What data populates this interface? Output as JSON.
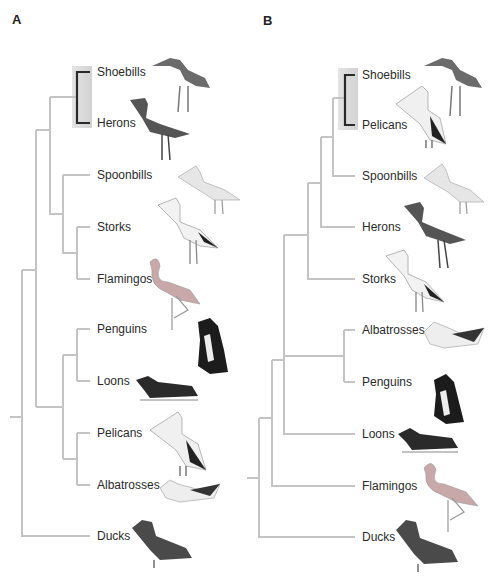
{
  "figure": {
    "panels": [
      {
        "id": "A",
        "letter": "A",
        "leaves": [
          {
            "name": "Shoebills",
            "y": 72
          },
          {
            "name": "Herons",
            "y": 123
          },
          {
            "name": "Spoonbills",
            "y": 175
          },
          {
            "name": "Storks",
            "y": 227
          },
          {
            "name": "Flamingos",
            "y": 279
          },
          {
            "name": "Penguins",
            "y": 329
          },
          {
            "name": "Loons",
            "y": 381
          },
          {
            "name": "Pelicans",
            "y": 433
          },
          {
            "name": "Albatrosses",
            "y": 485
          },
          {
            "name": "Ducks",
            "y": 536
          }
        ],
        "highlighted_sister_pair": [
          "Shoebills",
          "Herons"
        ],
        "topology": "((((Shoebills,Herons),(Spoonbills,(Storks,Flamingos))),((Penguins,Loons),(Pelicans,Albatrosses))),Ducks)"
      },
      {
        "id": "B",
        "letter": "B",
        "leaves": [
          {
            "name": "Shoebills",
            "y": 75
          },
          {
            "name": "Pelicans",
            "y": 125
          },
          {
            "name": "Spoonbills",
            "y": 176
          },
          {
            "name": "Herons",
            "y": 227
          },
          {
            "name": "Storks",
            "y": 279
          },
          {
            "name": "Albatrosses",
            "y": 330
          },
          {
            "name": "Penguins",
            "y": 382
          },
          {
            "name": "Loons",
            "y": 434
          },
          {
            "name": "Flamingos",
            "y": 486
          },
          {
            "name": "Ducks",
            "y": 537
          }
        ],
        "highlighted_sister_pair": [
          "Shoebills",
          "Pelicans"
        ],
        "topology": "((((((Shoebills,Pelicans),Spoonbills),Herons),Storks),((Albatrosses,Penguins),Loons)),Flamingos),Ducks)"
      }
    ],
    "colors": {
      "branch": "#c4c4c4",
      "highlight_bracket": "#2a2a2a",
      "highlight_box": "#d9d9d9"
    }
  }
}
